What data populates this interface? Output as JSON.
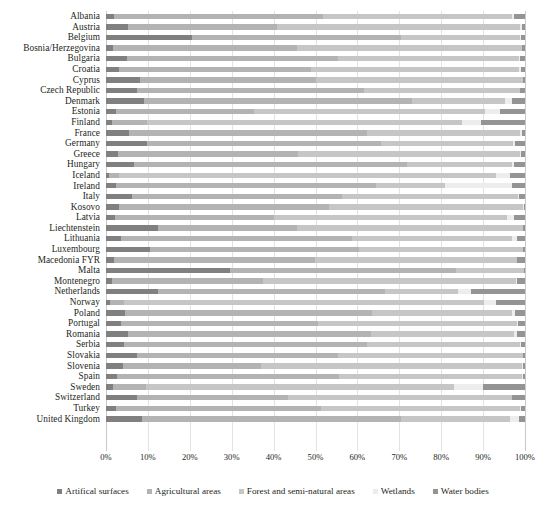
{
  "chart_data": {
    "type": "bar",
    "orientation": "horizontal",
    "stacked": true,
    "normalized": "percent",
    "title": "",
    "xlabel": "",
    "ylabel": "",
    "xlim": [
      0,
      100
    ],
    "xticks": [
      "0%",
      "10%",
      "20%",
      "30%",
      "40%",
      "50%",
      "60%",
      "70%",
      "80%",
      "90%",
      "100%"
    ],
    "grid": true,
    "legend_position": "bottom",
    "series": [
      {
        "name": "Artifical surfaces",
        "color": "#808080"
      },
      {
        "name": "Agricultural areas",
        "color": "#b3b3b3"
      },
      {
        "name": "Forest and semi-natural areas",
        "color": "#c6c6c6"
      },
      {
        "name": "Wetlands",
        "color": "#ededed"
      },
      {
        "name": "Water bodies",
        "color": "#949494"
      }
    ],
    "categories": [
      "Albania",
      "Austria",
      "Belgium",
      "Bosnia/Herzegovina",
      "Bulgaria",
      "Croatia",
      "Cyprus",
      "Czech Republic",
      "Denmark",
      "Estonia",
      "Finland",
      "France",
      "Germany",
      "Greece",
      "Hungary",
      "Iceland",
      "Ireland",
      "Italy",
      "Kosovo",
      "Latvia",
      "Liechtenstein",
      "Lithuania",
      "Luxembourg",
      "Macedonia FYR",
      "Malta",
      "Montenegro",
      "Netherlands",
      "Norway",
      "Poland",
      "Portugal",
      "Romania",
      "Serbia",
      "Slovakia",
      "Slovenia",
      "Spain",
      "Sweden",
      "Switzerland",
      "Turkey",
      "United Kingdom"
    ],
    "values": [
      {
        "category": "Albania",
        "artifical": 1.8,
        "agricultural": 50.0,
        "forest": 45.2,
        "wetlands": 0.4,
        "water": 2.6
      },
      {
        "category": "Austria",
        "artifical": 5.2,
        "agricultural": 35.5,
        "forest": 58.2,
        "wetlands": 0.3,
        "water": 0.8
      },
      {
        "category": "Belgium",
        "artifical": 20.5,
        "agricultural": 50.0,
        "forest": 28.4,
        "wetlands": 0.2,
        "water": 0.9
      },
      {
        "category": "Bosnia/Herzegovina",
        "artifical": 1.7,
        "agricultural": 44.0,
        "forest": 53.6,
        "wetlands": 0.1,
        "water": 0.6
      },
      {
        "category": "Bulgaria",
        "artifical": 5.1,
        "agricultural": 50.2,
        "forest": 43.3,
        "wetlands": 0.2,
        "water": 1.2
      },
      {
        "category": "Croatia",
        "artifical": 3.0,
        "agricultural": 46.0,
        "forest": 49.6,
        "wetlands": 0.4,
        "water": 1.0
      },
      {
        "category": "Cyprus",
        "artifical": 8.2,
        "agricultural": 42.0,
        "forest": 49.3,
        "wetlands": 0.1,
        "water": 0.4
      },
      {
        "category": "Czech Republic",
        "artifical": 7.5,
        "agricultural": 54.0,
        "forest": 37.2,
        "wetlands": 0.2,
        "water": 1.1
      },
      {
        "category": "Denmark",
        "artifical": 9.0,
        "agricultural": 64.0,
        "forest": 22.3,
        "wetlands": 1.5,
        "water": 3.2
      },
      {
        "category": "Estonia",
        "artifical": 2.4,
        "agricultural": 33.0,
        "forest": 55.0,
        "wetlands": 3.6,
        "water": 6.0
      },
      {
        "category": "Finland",
        "artifical": 1.4,
        "agricultural": 8.5,
        "forest": 75.1,
        "wetlands": 4.5,
        "water": 10.5
      },
      {
        "category": "France",
        "artifical": 5.4,
        "agricultural": 57.0,
        "forest": 36.3,
        "wetlands": 0.5,
        "water": 0.8
      },
      {
        "category": "Germany",
        "artifical": 9.7,
        "agricultural": 56.0,
        "forest": 31.5,
        "wetlands": 0.5,
        "water": 2.3
      },
      {
        "category": "Greece",
        "artifical": 2.8,
        "agricultural": 43.0,
        "forest": 52.9,
        "wetlands": 0.3,
        "water": 1.0
      },
      {
        "category": "Hungary",
        "artifical": 6.8,
        "agricultural": 65.0,
        "forest": 25.0,
        "wetlands": 0.6,
        "water": 2.6
      },
      {
        "category": "Iceland",
        "artifical": 0.6,
        "agricultural": 2.4,
        "forest": 90.0,
        "wetlands": 3.5,
        "water": 3.5
      },
      {
        "category": "Ireland",
        "artifical": 2.5,
        "agricultural": 62.0,
        "forest": 16.5,
        "wetlands": 16.0,
        "water": 3.0
      },
      {
        "category": "Italy",
        "artifical": 6.3,
        "agricultural": 50.0,
        "forest": 42.0,
        "wetlands": 0.3,
        "water": 1.4
      },
      {
        "category": "Kosovo",
        "artifical": 3.2,
        "agricultural": 50.0,
        "forest": 46.4,
        "wetlands": 0.1,
        "water": 0.3
      },
      {
        "category": "Latvia",
        "artifical": 2.1,
        "agricultural": 38.0,
        "forest": 55.5,
        "wetlands": 1.8,
        "water": 2.6
      },
      {
        "category": "Liechtenstein",
        "artifical": 12.5,
        "agricultural": 33.0,
        "forest": 54.0,
        "wetlands": 0.1,
        "water": 0.4
      },
      {
        "category": "Lithuania",
        "artifical": 3.6,
        "agricultural": 55.0,
        "forest": 38.3,
        "wetlands": 1.2,
        "water": 1.9
      },
      {
        "category": "Luxembourg",
        "artifical": 10.5,
        "agricultural": 50.0,
        "forest": 39.0,
        "wetlands": 0.1,
        "water": 0.4
      },
      {
        "category": "Macedonia FYR",
        "artifical": 1.9,
        "agricultural": 48.0,
        "forest": 48.1,
        "wetlands": 0.1,
        "water": 1.9
      },
      {
        "category": "Malta",
        "artifical": 29.5,
        "agricultural": 54.0,
        "forest": 16.3,
        "wetlands": 0.0,
        "water": 0.2
      },
      {
        "category": "Montenegro",
        "artifical": 1.5,
        "agricultural": 36.0,
        "forest": 60.3,
        "wetlands": 0.2,
        "water": 2.0
      },
      {
        "category": "Netherlands",
        "artifical": 12.5,
        "agricultural": 54.0,
        "forest": 17.5,
        "wetlands": 3.0,
        "water": 13.0
      },
      {
        "category": "Norway",
        "artifical": 1.0,
        "agricultural": 3.3,
        "forest": 86.0,
        "wetlands": 2.7,
        "water": 7.0
      },
      {
        "category": "Poland",
        "artifical": 4.5,
        "agricultural": 59.0,
        "forest": 33.5,
        "wetlands": 0.5,
        "water": 2.5
      },
      {
        "category": "Portugal",
        "artifical": 3.6,
        "agricultural": 47.0,
        "forest": 47.4,
        "wetlands": 0.3,
        "water": 1.7
      },
      {
        "category": "Romania",
        "artifical": 5.3,
        "agricultural": 58.0,
        "forest": 34.1,
        "wetlands": 0.6,
        "water": 2.0
      },
      {
        "category": "Serbia",
        "artifical": 4.2,
        "agricultural": 58.0,
        "forest": 36.6,
        "wetlands": 0.2,
        "water": 1.0
      },
      {
        "category": "Slovakia",
        "artifical": 7.3,
        "agricultural": 48.0,
        "forest": 44.2,
        "wetlands": 0.1,
        "water": 0.4
      },
      {
        "category": "Slovenia",
        "artifical": 4.0,
        "agricultural": 33.0,
        "forest": 62.4,
        "wetlands": 0.1,
        "water": 0.5
      },
      {
        "category": "Spain",
        "artifical": 2.6,
        "agricultural": 53.0,
        "forest": 43.7,
        "wetlands": 0.2,
        "water": 0.5
      },
      {
        "category": "Sweden",
        "artifical": 1.6,
        "agricultural": 8.0,
        "forest": 73.4,
        "wetlands": 7.0,
        "water": 10.0
      },
      {
        "category": "Switzerland",
        "artifical": 7.5,
        "agricultural": 36.0,
        "forest": 53.3,
        "wetlands": 0.2,
        "water": 3.0
      },
      {
        "category": "Turkey",
        "artifical": 2.4,
        "agricultural": 49.0,
        "forest": 47.3,
        "wetlands": 0.3,
        "water": 1.0
      },
      {
        "category": "United Kingdom",
        "artifical": 8.5,
        "agricultural": 62.0,
        "forest": 26.0,
        "wetlands": 2.0,
        "water": 1.5
      }
    ]
  },
  "legend": {
    "items": [
      {
        "label": "Artifical surfaces",
        "color": "#808080"
      },
      {
        "label": "Agricultural areas",
        "color": "#b3b3b3"
      },
      {
        "label": "Forest and semi-natural areas",
        "color": "#c6c6c6"
      },
      {
        "label": "Wetlands",
        "color": "#ededed"
      },
      {
        "label": "Water bodies",
        "color": "#949494"
      }
    ]
  }
}
